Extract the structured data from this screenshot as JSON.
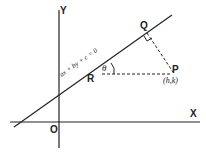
{
  "diagram": {
    "axes": {
      "x_label": "X",
      "y_label": "Y",
      "origin_label": "O"
    },
    "line": {
      "equation": "ax + by + c = 0"
    },
    "points": {
      "P": {
        "label": "P",
        "coords": "(h,k)"
      },
      "Q": {
        "label": "Q"
      },
      "R": {
        "label": "R"
      }
    },
    "angle": {
      "label": "θ"
    },
    "colors": {
      "stroke": "#222222",
      "background": "#ffffff"
    }
  }
}
